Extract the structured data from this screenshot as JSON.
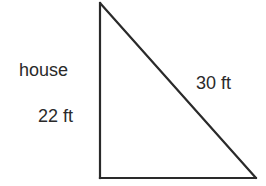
{
  "diagram": {
    "type": "right-triangle",
    "labels": {
      "vertical_side_name": "house",
      "vertical_side_length": "22 ft",
      "hypotenuse_length": "30 ft"
    },
    "colors": {
      "stroke": "#2a2a2a",
      "background": "#ffffff",
      "text": "#2a2a2a"
    },
    "vertices": {
      "top": [
        100,
        3
      ],
      "bottom_left": [
        100,
        178
      ],
      "bottom_right": [
        256,
        178
      ]
    }
  }
}
